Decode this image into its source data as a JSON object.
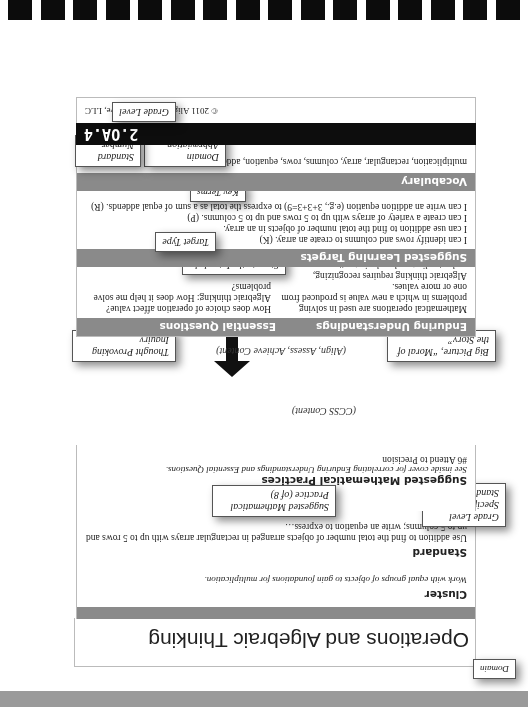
{
  "domain": {
    "title": "Operations and Algebraic Thinking"
  },
  "cluster": {
    "label": "Cluster",
    "text": "Work with equal groups of objects to gain foundations for multiplication."
  },
  "standard": {
    "label": "Standard",
    "text": "Use addition to find the total number of objects arranged in rectangular arrays with up to 5 rows and up to 5 columns; write an equation to express…"
  },
  "practices": {
    "label": "Suggested Mathematical Practices",
    "note": "See inside cover for correlating Enduring Understandings and Essential Questions.",
    "items": [
      "#6 Attend to Precision"
    ]
  },
  "divider": {
    "top_note": "(CCSS Content)",
    "bottom_note": "(Align, Assess, Achieve Content)",
    "icon": "double-arrow-vertical"
  },
  "understandings": {
    "label": "Enduring Understandings",
    "items": [
      "Mathematical operations are used in solving problems in which a new value is produced from one or more values.",
      "Algebraic thinking requires recognizing, understanding, and analyzing patterns."
    ]
  },
  "questions": {
    "label": "Essential Questions",
    "items": [
      "How does choice of operation affect value?",
      "Algebraic thinking: How does it help me solve problems?"
    ]
  },
  "targets": {
    "label": "Suggested Learning Targets",
    "items": [
      "I can identify rows and columns to create an array. (K)",
      "I can use addition to find the total number of objects in an array.",
      "I can create a variety of arrays with up to 5 rows and up to 5 columns. (P)",
      "I can write an addition equation (e.g., 3+3+3=9) to express the total as a sum of equal addends. (R)"
    ]
  },
  "vocabulary": {
    "label": "Vocabulary",
    "text": "multiplication, rectangular, array, columns, rows, equation, addends"
  },
  "code": {
    "text": "2.OA.4"
  },
  "footer": {
    "copyright": "© 2011 Align, Assess, Achieve, LLC"
  },
  "callouts": {
    "domain": "Domain",
    "grade_standard": "Grade Level Specific Standard",
    "practice": "Suggested Mathematical Practice (of 8)",
    "big_picture": "Big Picture, “Moral of the Story”",
    "inquiry": "Thought Provoking Inquiry",
    "steps": "Steps to the Intended Learning",
    "target_type": "Target Type",
    "key_terms": "Key Terms",
    "domain_abbrev": "Domain Abbreviation",
    "standard_number": "Standard Number",
    "grade_level": "Grade Level"
  },
  "colors": {
    "section_bar": "#8a8a8a",
    "code_bar": "#0d0d0d",
    "binding": "#0c0c0c"
  }
}
